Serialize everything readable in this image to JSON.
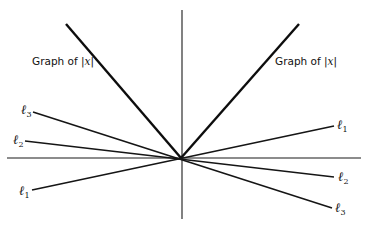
{
  "figure": {
    "abs_label_left": {
      "prefix": "Graph of ",
      "bar_open": "|",
      "var": "x",
      "bar_close": "|"
    },
    "abs_label_right": {
      "prefix": "Graph of ",
      "bar_open": "|",
      "var": "x",
      "bar_close": "|"
    },
    "lines": [
      {
        "id": "l1",
        "symbol": "ℓ",
        "subscript": "1"
      },
      {
        "id": "l2",
        "symbol": "ℓ",
        "subscript": "2"
      },
      {
        "id": "l3",
        "symbol": "ℓ",
        "subscript": "3"
      }
    ],
    "colors": {
      "ink": "#111111",
      "background": "#ffffff"
    }
  }
}
